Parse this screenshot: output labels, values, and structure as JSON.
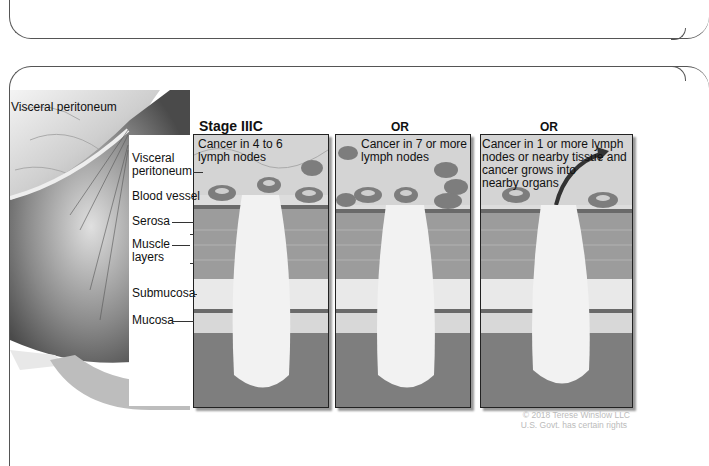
{
  "figure": {
    "top_label": "Visceral peritoneum",
    "stage_title": "Stage IIIC",
    "or_labels": [
      "OR",
      "OR"
    ],
    "panels": [
      {
        "caption_lines": [
          "Cancer in 4 to 6",
          "lymph nodes"
        ]
      },
      {
        "caption_lines": [
          "Cancer in 7 or more",
          "lymph nodes"
        ]
      },
      {
        "caption_lines": [
          "Cancer in 1 or more lymph",
          "nodes or nearby tissue and",
          "cancer grows into",
          "nearby organs"
        ]
      }
    ],
    "layer_labels": [
      {
        "lines": [
          "Visceral",
          "peritoneum"
        ]
      },
      {
        "lines": [
          "Blood vessel"
        ]
      },
      {
        "lines": [
          "Serosa"
        ]
      },
      {
        "lines": [
          "Muscle",
          "layers"
        ]
      },
      {
        "lines": [
          "Submucosa"
        ]
      },
      {
        "lines": [
          "Mucosa"
        ]
      }
    ],
    "credit_lines": [
      "© 2018 Terese Winslow LLC",
      "U.S. Govt. has certain rights"
    ],
    "colors": {
      "frame": "#555555",
      "text": "#111111",
      "credit": "#bbbbbb",
      "tissue_gray": "#8a8a8a",
      "tumor": "#f2f2f2"
    }
  }
}
